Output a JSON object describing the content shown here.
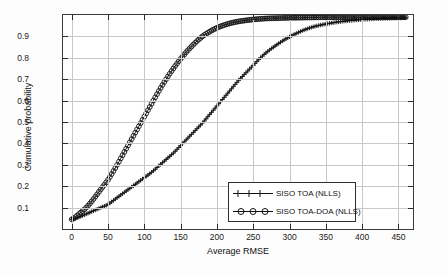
{
  "chart_data": {
    "type": "line",
    "title": "",
    "xlabel": "Average RMSE",
    "ylabel": "Cumulative probability",
    "xlim": [
      -12,
      470
    ],
    "ylim": [
      0.0,
      1.0
    ],
    "grid": true,
    "legend_position": "bottom-right",
    "xticks": [
      0,
      50,
      100,
      150,
      200,
      250,
      300,
      350,
      400,
      450
    ],
    "yticks": [
      0.1,
      0.2,
      0.3,
      0.4,
      0.5,
      0.6,
      0.7,
      0.8,
      0.9
    ],
    "xtick_labels": [
      "0",
      "50",
      "100",
      "150",
      "200",
      "250",
      "300",
      "350",
      "400",
      "450"
    ],
    "ytick_labels": [
      "0.1",
      "0.2",
      "0.3",
      "0.4",
      "0.5",
      "0.6",
      "0.7",
      "0.8",
      "0.9"
    ],
    "series": [
      {
        "name": "SISO TOA (NLLS)",
        "marker": "plus",
        "color": "#111111",
        "x": [
          0,
          10,
          20,
          30,
          40,
          50,
          60,
          70,
          80,
          90,
          100,
          110,
          120,
          130,
          140,
          150,
          160,
          170,
          180,
          190,
          200,
          210,
          220,
          230,
          240,
          250,
          260,
          270,
          280,
          290,
          300,
          310,
          320,
          330,
          340,
          350,
          360,
          370,
          380,
          390,
          400,
          410,
          420,
          430,
          440,
          450,
          460
        ],
        "y": [
          0.045,
          0.055,
          0.07,
          0.085,
          0.1,
          0.115,
          0.14,
          0.165,
          0.19,
          0.215,
          0.24,
          0.265,
          0.295,
          0.325,
          0.355,
          0.39,
          0.425,
          0.46,
          0.495,
          0.535,
          0.575,
          0.615,
          0.655,
          0.695,
          0.73,
          0.765,
          0.8,
          0.83,
          0.855,
          0.878,
          0.898,
          0.915,
          0.93,
          0.942,
          0.951,
          0.958,
          0.964,
          0.969,
          0.973,
          0.976,
          0.979,
          0.981,
          0.983,
          0.984,
          0.985,
          0.986,
          0.987
        ]
      },
      {
        "name": "SISO TOA-DOA (NLLS)",
        "marker": "circle",
        "color": "#111111",
        "x": [
          0,
          10,
          20,
          30,
          40,
          50,
          60,
          70,
          80,
          90,
          100,
          110,
          120,
          130,
          140,
          150,
          160,
          170,
          180,
          190,
          200,
          210,
          220,
          230,
          240,
          250,
          260,
          270,
          280,
          290,
          300,
          310,
          320,
          330,
          340,
          350,
          360,
          370,
          380,
          390,
          400,
          410,
          420,
          430,
          440,
          450,
          460
        ],
        "y": [
          0.045,
          0.07,
          0.1,
          0.14,
          0.185,
          0.23,
          0.285,
          0.345,
          0.405,
          0.465,
          0.525,
          0.585,
          0.645,
          0.7,
          0.75,
          0.795,
          0.835,
          0.87,
          0.9,
          0.922,
          0.94,
          0.953,
          0.963,
          0.97,
          0.975,
          0.979,
          0.982,
          0.984,
          0.985,
          0.986,
          0.987,
          0.9875,
          0.988,
          0.9885,
          0.989,
          0.9893,
          0.9896,
          0.9899,
          0.99,
          0.99,
          0.99,
          0.99,
          0.99,
          0.99,
          0.99,
          0.99,
          0.99
        ]
      }
    ]
  },
  "legend": {
    "items": [
      {
        "label": "SISO TOA (NLLS)"
      },
      {
        "label": "SISO TOA-DOA (NLLS)"
      }
    ]
  }
}
